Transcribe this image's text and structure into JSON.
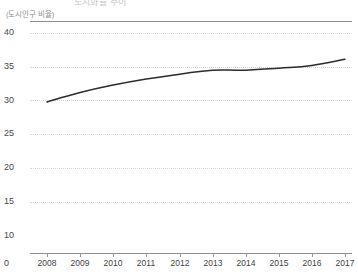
{
  "header": {
    "clipped_title": "도시화율 추이",
    "unit_caption": "(도시인구 비율)"
  },
  "axis": {
    "zero_label": "0",
    "y_ticks": [
      "40",
      "35",
      "30",
      "25",
      "20",
      "15",
      "10"
    ],
    "x_ticks": [
      "2008",
      "2009",
      "2010",
      "2011",
      "2012",
      "2013",
      "2014",
      "2015",
      "2016",
      "2017"
    ]
  },
  "style": {
    "line_color": "#2b2b2b",
    "grid_color": "#d6d6d6",
    "axis_color": "#8e8e8e",
    "text_color": "#3f3f3f"
  },
  "chart_data": {
    "type": "line",
    "title": "도시화율 추이",
    "xlabel": "",
    "ylabel": "(도시인구 비율)",
    "ylim": [
      10,
      40
    ],
    "y_ticks": [
      10,
      15,
      20,
      25,
      30,
      35,
      40
    ],
    "grid": true,
    "legend": "none",
    "x": [
      2008,
      2009,
      2010,
      2011,
      2012,
      2013,
      2014,
      2015,
      2016,
      2017
    ],
    "categories": [
      "2008",
      "2009",
      "2010",
      "2011",
      "2012",
      "2013",
      "2014",
      "2015",
      "2016",
      "2017"
    ],
    "series": [
      {
        "name": "도시인구 비율",
        "values": [
          29.8,
          31.2,
          32.3,
          33.2,
          33.9,
          34.5,
          34.5,
          34.8,
          35.2,
          36.1
        ]
      }
    ]
  }
}
